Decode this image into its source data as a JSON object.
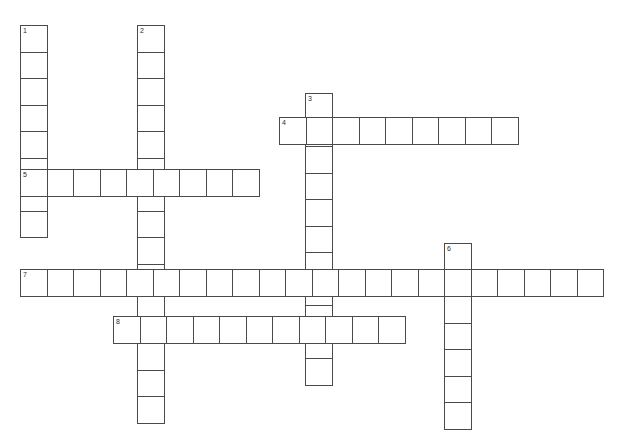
{
  "page": {
    "background_color": "#ffffff",
    "cell_fill_color": "#ffffff",
    "cell_border_color": "#4a4a4a",
    "number_color": "#2b2b2b",
    "width": 632,
    "height": 436
  },
  "grid": {
    "cell_size": 26.5,
    "origin_x": 20,
    "origin_y": 25,
    "border_width": 1
  },
  "entries": [
    {
      "number": "1",
      "direction": "down",
      "length": 8,
      "start_x": 20,
      "start_y": 25
    },
    {
      "number": "2",
      "direction": "down",
      "length": 15,
      "start_x": 137,
      "start_y": 25
    },
    {
      "number": "3",
      "direction": "down",
      "length": 11,
      "start_x": 305,
      "start_y": 93
    },
    {
      "number": "4",
      "direction": "across",
      "length": 9,
      "start_x": 279,
      "start_y": 117
    },
    {
      "number": "5",
      "direction": "across",
      "length": 9,
      "start_x": 20,
      "start_y": 169
    },
    {
      "number": "6",
      "direction": "down",
      "length": 7,
      "start_x": 444,
      "start_y": 243
    },
    {
      "number": "7",
      "direction": "across",
      "length": 22,
      "start_x": 20,
      "start_y": 269
    },
    {
      "number": "8",
      "direction": "across",
      "length": 11,
      "start_x": 113,
      "start_y": 316
    }
  ],
  "letters": []
}
